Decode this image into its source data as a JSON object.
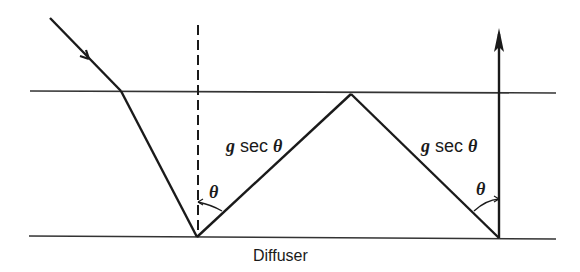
{
  "diagram": {
    "labels": {
      "segment_left": {
        "g": "g",
        "sec": " sec ",
        "theta": "θ"
      },
      "segment_right": {
        "g": "g",
        "sec": " sec ",
        "theta": "θ"
      },
      "angle_left": "θ",
      "angle_right": "θ",
      "bottom_surface": "Diffuser"
    },
    "colors": {
      "line": "#1a1a1a",
      "surface": "#333333",
      "background": "#ffffff"
    }
  }
}
